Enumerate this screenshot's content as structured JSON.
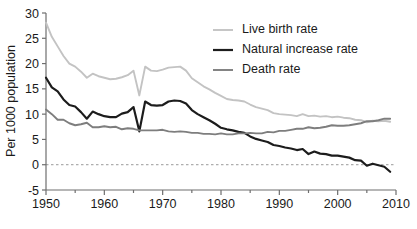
{
  "chart_data": {
    "type": "line",
    "title": "",
    "xlabel": "",
    "ylabel": "Per 1000 population",
    "xlim": [
      1950,
      2010
    ],
    "ylim": [
      -5,
      30
    ],
    "ytick_values": [
      -5,
      0,
      5,
      10,
      15,
      20,
      25,
      30
    ],
    "ytick_labels": [
      "-5",
      "0",
      "5",
      "10",
      "15",
      "20",
      "25",
      "30"
    ],
    "xtick_values": [
      1950,
      1960,
      1970,
      1980,
      1990,
      2000,
      2010
    ],
    "xtick_labels": [
      "1950",
      "1960",
      "1970",
      "1980",
      "1990",
      "2000",
      "2010"
    ],
    "x_minor_ticks": [
      1955,
      1965,
      1975,
      1985,
      1995,
      2005
    ],
    "grid": false,
    "zero_reference_line": 0,
    "legend_position": "top-right",
    "x": [
      1950,
      1951,
      1952,
      1953,
      1954,
      1955,
      1956,
      1957,
      1958,
      1959,
      1960,
      1961,
      1962,
      1963,
      1964,
      1965,
      1966,
      1967,
      1968,
      1969,
      1970,
      1971,
      1972,
      1973,
      1974,
      1975,
      1976,
      1977,
      1978,
      1979,
      1980,
      1981,
      1982,
      1983,
      1984,
      1985,
      1986,
      1987,
      1988,
      1989,
      1990,
      1991,
      1992,
      1993,
      1994,
      1995,
      1996,
      1997,
      1998,
      1999,
      2000,
      2001,
      2002,
      2003,
      2004,
      2005,
      2006,
      2007,
      2008,
      2009
    ],
    "series": [
      {
        "name": "Live birth rate",
        "color": "#c3c3c3",
        "values": [
          28.1,
          25.3,
          23.4,
          21.5,
          20.0,
          19.4,
          18.4,
          17.2,
          18.0,
          17.5,
          17.2,
          16.9,
          17.0,
          17.3,
          17.7,
          18.6,
          13.7,
          19.4,
          18.6,
          18.5,
          18.8,
          19.2,
          19.3,
          19.4,
          18.6,
          17.1,
          16.3,
          15.5,
          14.9,
          14.2,
          13.6,
          13.0,
          12.8,
          12.7,
          12.5,
          11.9,
          11.4,
          11.1,
          10.8,
          10.2,
          10.0,
          9.9,
          9.8,
          9.6,
          10.0,
          9.6,
          9.7,
          9.5,
          9.6,
          9.4,
          9.5,
          9.3,
          9.2,
          8.9,
          8.8,
          8.4,
          8.7,
          8.6,
          8.7,
          8.5
        ]
      },
      {
        "name": "Natural increase rate",
        "color": "#1c1c1c",
        "values": [
          17.2,
          15.3,
          14.5,
          12.9,
          11.8,
          11.5,
          10.4,
          9.1,
          10.5,
          10.0,
          9.6,
          9.4,
          9.4,
          10.1,
          10.4,
          11.4,
          6.6,
          12.5,
          11.8,
          11.7,
          11.8,
          12.5,
          12.7,
          12.6,
          12.1,
          10.8,
          10.0,
          9.4,
          8.8,
          8.1,
          7.3,
          7.0,
          6.8,
          6.5,
          6.3,
          5.6,
          5.1,
          4.8,
          4.5,
          3.9,
          3.7,
          3.4,
          3.2,
          2.9,
          3.1,
          2.1,
          2.6,
          2.2,
          2.1,
          1.8,
          1.8,
          1.6,
          1.4,
          0.9,
          0.8,
          -0.2,
          0.2,
          -0.1,
          -0.4,
          -1.4
        ]
      },
      {
        "name": "Death rate",
        "color": "#7e7e7e",
        "values": [
          10.9,
          10.0,
          8.9,
          8.9,
          8.2,
          7.8,
          8.0,
          8.3,
          7.4,
          7.4,
          7.6,
          7.4,
          7.5,
          7.0,
          7.2,
          7.1,
          6.8,
          6.8,
          6.8,
          6.8,
          6.9,
          6.6,
          6.5,
          6.6,
          6.5,
          6.3,
          6.3,
          6.1,
          6.1,
          6.0,
          6.2,
          6.0,
          6.0,
          6.2,
          6.2,
          6.3,
          6.2,
          6.2,
          6.5,
          6.4,
          6.7,
          6.7,
          6.9,
          7.1,
          7.1,
          7.4,
          7.2,
          7.3,
          7.5,
          7.8,
          7.7,
          7.7,
          7.8,
          8.0,
          8.2,
          8.6,
          8.6,
          8.8,
          9.1,
          9.1
        ]
      }
    ]
  },
  "legend": {
    "entries": [
      {
        "label": "Live birth rate"
      },
      {
        "label": "Natural increase rate"
      },
      {
        "label": "Death rate"
      }
    ]
  }
}
